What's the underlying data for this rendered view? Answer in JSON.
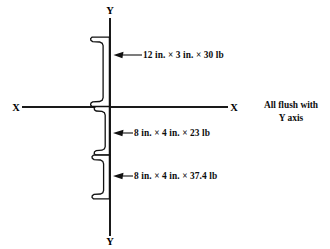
{
  "figure": {
    "background_color": "#ffffff",
    "line_color": "#111111"
  },
  "axes": {
    "vertical": {
      "name": "Y axis",
      "top_label": "Y",
      "bottom_label": "Y",
      "x": 110,
      "y_top": 18,
      "y_bottom": 236
    },
    "horizontal": {
      "name": "X axis",
      "left_label": "X",
      "right_label": "X",
      "y": 107,
      "x_left": 22,
      "x_right": 228
    }
  },
  "sections": [
    {
      "id": "channel-top",
      "label": "12 in. × 3 in. × 30 lb",
      "depth_in": 12,
      "flange_width_in": 3,
      "weight_lb_per_ft": 30,
      "orientation": "opens-left",
      "flush_edge": "Y axis"
    },
    {
      "id": "channel-middle",
      "label": "8 in. × 4 in. × 23 lb",
      "depth_in": 8,
      "flange_width_in": 4,
      "weight_lb_per_ft": 23,
      "orientation": "opens-left",
      "flush_edge": "Y axis"
    },
    {
      "id": "channel-bottom",
      "label": "8 in. × 4 in. × 37.4 lb",
      "depth_in": 8,
      "flange_width_in": 4,
      "weight_lb_per_ft": 37.4,
      "orientation": "opens-left",
      "flush_edge": "Y axis"
    }
  ],
  "note": {
    "line1": "All flush with",
    "line2": "Y axis"
  }
}
